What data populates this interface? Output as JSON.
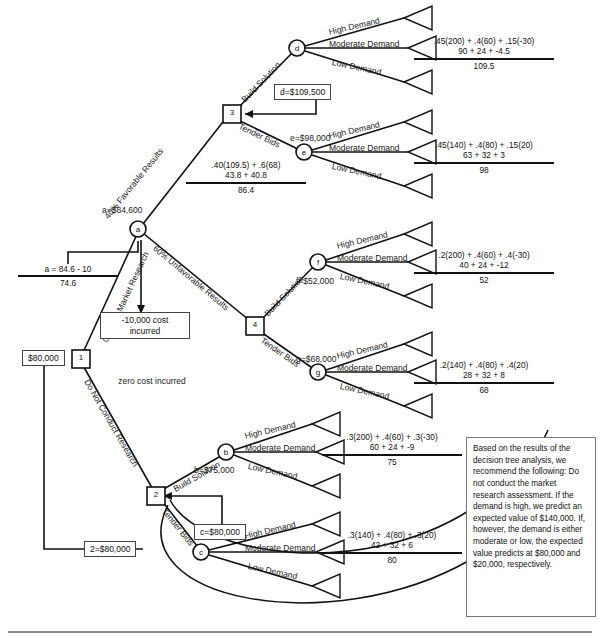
{
  "diagram": {
    "title": "Decision Tree Analysis",
    "type": "decision-tree",
    "colors": {
      "line": "#111111",
      "box_border": "#444444",
      "text": "#1a1a1a",
      "background": "#ffffff"
    }
  },
  "nodes": {
    "decision_1": "1",
    "decision_2": "2",
    "decision_3": "3",
    "decision_4": "4",
    "chance_a": "a",
    "chance_b": "b",
    "chance_c": "c",
    "chance_d": "d",
    "chance_e": "e",
    "chance_f": "f",
    "chance_g": "g"
  },
  "branch_labels": {
    "conduct_market_research": "Conduct Market Research",
    "do_not_conduct_research": "Do Not Conduct Research",
    "favorable": "40% Favorable Results",
    "unfavorable": "60% Unfavorable Results",
    "build_solution_3": "Build Solution",
    "tender_bids_3": "Tender Bids",
    "build_solution_4": "Build Solution",
    "tender_bids_4": "Tender Bids",
    "build_solution_2": "Build Solution",
    "tender_bids_2": "Tender Bids"
  },
  "demand_labels": {
    "high": "High Demand",
    "moderate": "Moderate Demand",
    "low": "Low Demand"
  },
  "values": {
    "start_value": "$80,000",
    "a_value": "a=$84,600",
    "b_value": "b=$75,000",
    "c_value": "c=$80,000",
    "d_value": "d=$109,500",
    "e_value": "e=$98,000",
    "f_value": "f=$52,000",
    "g_value": "g=$68,000",
    "node2_value": "2=$80,000",
    "cost_incurred": "-10,000 cost incurred",
    "zero_cost": "zero cost incurred"
  },
  "calculations": {
    "d": {
      "line1": ".45(200) + .4(60) + .15(-30)",
      "line2": "90 + 24 + -4.5",
      "result": "109.5"
    },
    "e": {
      "line1": ".45(140) + .4(80) + .15(20)",
      "line2": "63 + 32 + 3",
      "result": "98"
    },
    "f": {
      "line1": ".2(200) + .4(60) + .4(-30)",
      "line2": "40 + 24 + -12",
      "result": "52"
    },
    "g": {
      "line1": ".2(140) + .4(80) + .4(20)",
      "line2": "28 + 32 + 8",
      "result": "68"
    },
    "b": {
      "line1": ".3(200) + .4(60) + .3(-30)",
      "line2": "60 + 24 + -9",
      "result": "75"
    },
    "c": {
      "line1": ".3(140) + .4(80) + .3(20)",
      "line2": "42 + 32 + 6",
      "result": "80"
    },
    "node3": {
      "line1": ".40(109.5) + .6(68)",
      "line2": "43.8 + 40.8",
      "result": "86.4"
    },
    "node_a": {
      "line1": "a = 84.6 - 10",
      "line2": "",
      "result": "74.6"
    }
  },
  "recommendation": {
    "text": "Based on the results of the decision tree analysis, we recommend the following: Do not conduct the market research assessment. If the demand is high, we predict an expected value of $140,000. If, however, the demand is either moderate or low, the expected value predicts at $80,000 and $20,000, respectively."
  }
}
